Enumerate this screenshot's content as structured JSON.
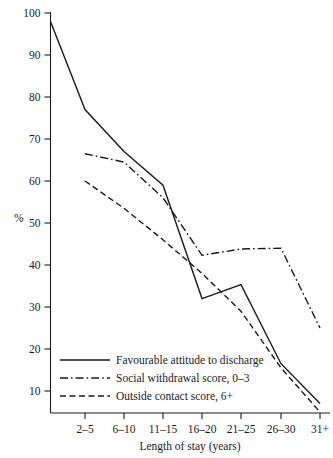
{
  "chart_data": {
    "type": "line",
    "title": "",
    "xlabel": "Length of stay (years)",
    "ylabel": "%",
    "categories": [
      "2–5",
      "6–10",
      "11–15",
      "16–20",
      "21–25",
      "26–30",
      "31+"
    ],
    "ylim": [
      0,
      100
    ],
    "yticks": [
      10,
      20,
      30,
      40,
      50,
      60,
      70,
      80,
      90,
      100
    ],
    "ytick_labels": [
      "10",
      "20",
      "30",
      "40",
      "50",
      "60",
      "70",
      "80",
      "90",
      "100"
    ],
    "grid": false,
    "legend_position": "lower-left-inside",
    "series": [
      {
        "name": "Favourable attitude to discharge",
        "style": "solid",
        "origin_value": 98,
        "values": [
          77,
          67,
          59,
          32,
          35.3,
          16.5,
          7
        ]
      },
      {
        "name": "Social withdrawal score, 0–3",
        "style": "dash-dot",
        "origin_value": null,
        "values": [
          66.5,
          64.5,
          56,
          42.3,
          43.8,
          44,
          25
        ]
      },
      {
        "name": "Outside contact score, 6+",
        "style": "dashed",
        "origin_value": null,
        "values": [
          60,
          53.5,
          46,
          38,
          29,
          15.5,
          5
        ]
      }
    ]
  },
  "axes": {
    "y_axis_label": "%",
    "x_axis_label": "Length of stay (years)"
  },
  "legend": {
    "items": [
      {
        "label": "Favourable attitude to discharge",
        "style": "solid"
      },
      {
        "label": "Social withdrawal score, 0–3",
        "style": "dash-dot"
      },
      {
        "label": "Outside contact score, 6+",
        "style": "dashed"
      }
    ]
  }
}
